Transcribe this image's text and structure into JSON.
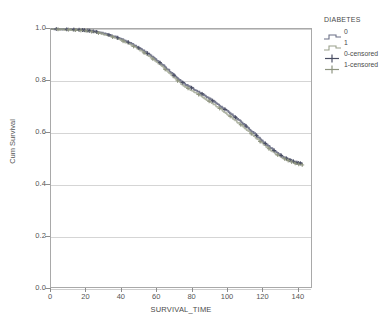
{
  "chart_data": {
    "type": "line",
    "title": "",
    "xlabel": "SURVIVAL_TIME",
    "ylabel": "Cum Survival",
    "xlim": [
      0,
      148
    ],
    "ylim": [
      0.0,
      1.0
    ],
    "xticks": [
      0,
      20,
      40,
      60,
      80,
      100,
      120,
      140
    ],
    "yticks": [
      "0.0",
      "0.2",
      "0.4",
      "0.6",
      "0.8",
      "1.0"
    ],
    "grid": true,
    "legend_position": "right-outside",
    "legend_title": "DIABETES",
    "series": [
      {
        "name": "0",
        "color": "#6b6f86",
        "style": "step",
        "x": [
          0,
          4,
          8,
          12,
          16,
          20,
          24,
          28,
          32,
          36,
          40,
          44,
          48,
          52,
          56,
          60,
          64,
          68,
          72,
          76,
          80,
          84,
          88,
          92,
          96,
          100,
          104,
          108,
          112,
          116,
          120,
          124,
          128,
          132,
          136,
          140,
          143
        ],
        "y": [
          1.0,
          1.0,
          0.999,
          0.998,
          0.997,
          0.995,
          0.991,
          0.986,
          0.979,
          0.971,
          0.961,
          0.949,
          0.935,
          0.919,
          0.901,
          0.881,
          0.858,
          0.833,
          0.808,
          0.787,
          0.772,
          0.757,
          0.74,
          0.722,
          0.703,
          0.683,
          0.663,
          0.641,
          0.618,
          0.594,
          0.568,
          0.545,
          0.524,
          0.505,
          0.492,
          0.482,
          0.478
        ]
      },
      {
        "name": "1",
        "color": "#9aa08c",
        "style": "step",
        "x": [
          0,
          4,
          8,
          12,
          16,
          20,
          24,
          28,
          32,
          36,
          40,
          44,
          48,
          52,
          56,
          60,
          64,
          68,
          72,
          76,
          80,
          84,
          88,
          92,
          96,
          100,
          104,
          108,
          112,
          116,
          120,
          124,
          128,
          132,
          136,
          140,
          143
        ],
        "y": [
          1.0,
          0.999,
          0.998,
          0.997,
          0.995,
          0.993,
          0.989,
          0.983,
          0.976,
          0.967,
          0.956,
          0.943,
          0.929,
          0.912,
          0.894,
          0.873,
          0.85,
          0.824,
          0.799,
          0.778,
          0.762,
          0.746,
          0.729,
          0.711,
          0.692,
          0.672,
          0.651,
          0.629,
          0.606,
          0.582,
          0.558,
          0.536,
          0.516,
          0.5,
          0.487,
          0.477,
          0.473
        ]
      }
    ],
    "censor_marks": [
      {
        "series": "0-censored",
        "x": [
          3,
          9,
          13,
          16,
          18,
          19,
          21,
          22,
          24,
          26,
          33,
          38,
          44,
          50,
          55,
          62,
          70,
          75,
          80,
          86,
          92,
          99,
          105,
          111,
          117,
          122,
          127,
          131,
          134,
          136,
          138,
          140,
          141,
          142
        ],
        "color": "#4a4e63"
      },
      {
        "series": "1-censored",
        "x": [
          4,
          10,
          14,
          17,
          20,
          23,
          27,
          35,
          41,
          47,
          53,
          58,
          65,
          72,
          78,
          84,
          90,
          96,
          102,
          108,
          114,
          119,
          124,
          129,
          133,
          135,
          137,
          139,
          141,
          143
        ],
        "color": "#8e9480"
      }
    ]
  },
  "legend": {
    "title": "DIABETES",
    "items": [
      {
        "label": "0",
        "color": "#6b6f86",
        "marker": "step-line"
      },
      {
        "label": "1",
        "color": "#9aa08c",
        "marker": "step-line"
      },
      {
        "label": "0-censored",
        "color": "#4a4e63",
        "marker": "plus"
      },
      {
        "label": "1-censored",
        "color": "#8e9480",
        "marker": "plus"
      }
    ]
  },
  "axes": {
    "x_title": "SURVIVAL_TIME",
    "y_title": "Cum Survival",
    "x_tick_labels": [
      "0",
      "20",
      "40",
      "60",
      "80",
      "100",
      "120",
      "140"
    ],
    "y_tick_labels": [
      "1.0",
      "0.8",
      "0.6",
      "0.4",
      "0.2",
      "0.0"
    ]
  }
}
